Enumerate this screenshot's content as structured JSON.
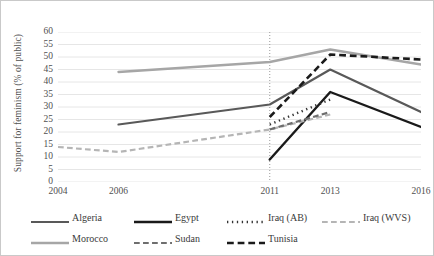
{
  "chart_data": {
    "type": "line",
    "title": "",
    "xlabel": "",
    "ylabel": "Support for feminism (% of public)",
    "xticklabels": [
      "2004",
      "2006",
      "2011",
      "2013",
      "2016"
    ],
    "xtickvalues": [
      2004,
      2006,
      2011,
      2013,
      2016
    ],
    "xlim": [
      2004,
      2016
    ],
    "ylim": [
      0,
      60
    ],
    "yticks": [
      0,
      5,
      10,
      15,
      20,
      25,
      30,
      35,
      40,
      45,
      50,
      55,
      60
    ],
    "grid": "horizontal",
    "legend_position": "bottom",
    "annotations": [
      {
        "type": "vertical-dotted-line",
        "x": 2011,
        "label": "2011"
      }
    ],
    "series": [
      {
        "name": "Algeria",
        "style": "solid",
        "color": "#595959",
        "width": 2.2,
        "x": [
          2006,
          2011,
          2013,
          2016
        ],
        "values": [
          23,
          31,
          45,
          28
        ]
      },
      {
        "name": "Egypt",
        "style": "solid",
        "color": "#1a1a1a",
        "width": 2.4,
        "x": [
          2011,
          2013,
          2016
        ],
        "values": [
          9,
          36,
          22
        ]
      },
      {
        "name": "Iraq (AB)",
        "style": "dotted",
        "color": "#333333",
        "width": 2.4,
        "x": [
          2011,
          2013
        ],
        "values": [
          23,
          33
        ]
      },
      {
        "name": "Iraq (WVS)",
        "style": "dashed",
        "color": "#b5b5b5",
        "width": 2.2,
        "x": [
          2004,
          2006,
          2011,
          2013
        ],
        "values": [
          14,
          12,
          21,
          27
        ]
      },
      {
        "name": "Morocco",
        "style": "solid",
        "color": "#a6a6a6",
        "width": 2.4,
        "x": [
          2006,
          2011,
          2013,
          2016
        ],
        "values": [
          44,
          48,
          53,
          47
        ]
      },
      {
        "name": "Sudan",
        "style": "dashed",
        "color": "#6e6e6e",
        "width": 2.2,
        "x": [
          2011,
          2013
        ],
        "values": [
          21,
          28
        ]
      },
      {
        "name": "Tunisia",
        "style": "dashed",
        "color": "#1a1a1a",
        "width": 2.6,
        "x": [
          2011,
          2013,
          2016
        ],
        "values": [
          26,
          51,
          49
        ]
      }
    ]
  },
  "legend": {
    "rows": [
      [
        {
          "label": "Algeria",
          "series": "Algeria"
        },
        {
          "label": "Egypt",
          "series": "Egypt"
        },
        {
          "label": "Iraq (AB)",
          "series": "Iraq (AB)"
        },
        {
          "label": "Iraq (WVS)",
          "series": "Iraq (WVS)"
        }
      ],
      [
        {
          "label": "Morocco",
          "series": "Morocco"
        },
        {
          "label": "Sudan",
          "series": "Sudan"
        },
        {
          "label": "Tunisia",
          "series": "Tunisia"
        }
      ]
    ]
  },
  "colors": {
    "gridline": "#e6e6e6",
    "axis_text": "#4f4f4f",
    "frame": "#c9c9c9"
  }
}
